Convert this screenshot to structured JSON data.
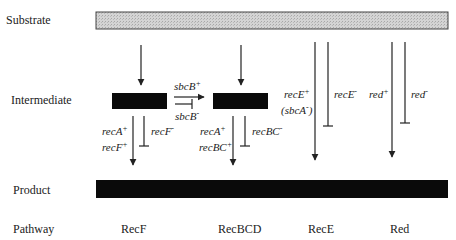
{
  "rows": {
    "substrate": "Substrate",
    "intermediate": "Intermediate",
    "product": "Product",
    "pathway": "Pathway"
  },
  "pathways": [
    "RecF",
    "RecBCD",
    "RecE",
    "Red"
  ],
  "genes": {
    "sbcB_plus": {
      "base": "sbcB",
      "sup": "+"
    },
    "sbcB_minus": {
      "base": "sbcB",
      "sup": "-"
    },
    "recA_plus_1": {
      "base": "recA",
      "sup": "+"
    },
    "recF_plus": {
      "base": "recF",
      "sup": "+"
    },
    "recF_minus": {
      "base": "recF",
      "sup": "-"
    },
    "recA_plus_2": {
      "base": "recA",
      "sup": "+"
    },
    "recBC_plus": {
      "base": "recBC",
      "sup": "+"
    },
    "recBC_minus": {
      "base": "recBC",
      "sup": "-"
    },
    "recE_plus": {
      "base": "recE",
      "sup": "+"
    },
    "sbcA_minus": {
      "pre": "(sbcA",
      "sup": "-",
      "post": ")"
    },
    "recE_minus": {
      "base": "recE",
      "sup": "-"
    },
    "red_plus": {
      "base": "red",
      "sup": "+"
    },
    "red_minus": {
      "base": "red",
      "sup": "-"
    }
  },
  "colors": {
    "substrate_fill": "#cfcfcf",
    "block_fill": "#0a0a0a",
    "line": "#222222"
  }
}
